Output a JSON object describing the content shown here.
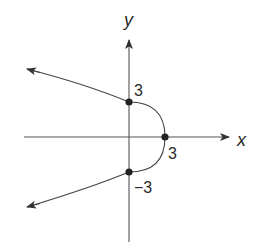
{
  "diagram": {
    "type": "coordinate-graph",
    "equation": "x = 3 - y^2/3",
    "axes": {
      "x_label": "x",
      "y_label": "y"
    },
    "labeled_points": [
      {
        "name": "y-intercept-top",
        "x": 0,
        "y": 3,
        "label": "3"
      },
      {
        "name": "vertex",
        "x": 3,
        "y": 0,
        "label": "3"
      },
      {
        "name": "y-intercept-bottom",
        "x": 0,
        "y": -3,
        "label": "−3"
      }
    ],
    "colors": {
      "stroke": "#444444",
      "axis": "#555555",
      "point": "#222222",
      "text": "#2a2a2a"
    }
  }
}
